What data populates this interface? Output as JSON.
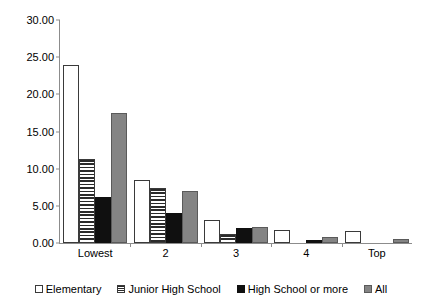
{
  "chart_data": {
    "type": "bar",
    "title": "",
    "xlabel": "",
    "ylabel": "",
    "ylim": [
      0,
      30
    ],
    "ytick_labels": [
      "0.00",
      "5.00",
      "10.00",
      "15.00",
      "20.00",
      "25.00",
      "30.00"
    ],
    "ytick_values": [
      0,
      5,
      10,
      15,
      20,
      25,
      30
    ],
    "grid": false,
    "legend_position": "bottom",
    "categories": [
      "Lowest",
      "2",
      "3",
      "4",
      "Top"
    ],
    "series": [
      {
        "name": "Elementary",
        "color": "#ffffff",
        "pattern": "hollow",
        "values": [
          23.9,
          8.5,
          3.1,
          1.7,
          1.6
        ]
      },
      {
        "name": "Junior High School",
        "color": "#ffffff",
        "pattern": "horizontal",
        "values": [
          11.3,
          7.4,
          1.2,
          0.0,
          0.0
        ]
      },
      {
        "name": "High School or more",
        "color": "#101010",
        "pattern": "solid",
        "values": [
          6.2,
          4.0,
          2.0,
          0.4,
          0.0
        ]
      },
      {
        "name": "All",
        "color": "#848484",
        "pattern": "gray",
        "values": [
          17.5,
          7.0,
          2.1,
          0.8,
          0.5
        ]
      }
    ]
  },
  "axis": {
    "max": 30,
    "colors": {
      "axis_line": "#8c8c8c",
      "bar_border": "#3a3a3a",
      "gray_fill": "#848484",
      "black_fill": "#101010"
    }
  }
}
